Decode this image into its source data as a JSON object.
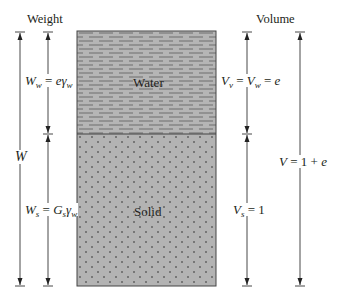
{
  "diagram": {
    "type": "soil-phase-diagram",
    "headers": {
      "left": "Weight",
      "right": "Volume"
    },
    "phases": [
      {
        "name": "water",
        "label": "Water",
        "pattern": "dashes",
        "fill": "#b3b3b3"
      },
      {
        "name": "solid",
        "label": "Solid",
        "pattern": "dots",
        "fill": "#b3b3b3"
      }
    ],
    "left_dimensions": {
      "total": {
        "symbol": "W"
      },
      "water": {
        "lhs": "W",
        "lhs_sub": "w",
        "eq": " = ",
        "rhs": "e",
        "rhs_sym": "γ",
        "rhs_sub": "w"
      },
      "solid": {
        "lhs": "W",
        "lhs_sub": "s",
        "eq": " = ",
        "rhs": "G",
        "rhs_sub1": "s",
        "rhs_sym": "γ",
        "rhs_sub": "w"
      }
    },
    "right_dimensions": {
      "voids": {
        "lhs": "V",
        "lhs_sub": "v",
        "eq1": " = ",
        "mid": "V",
        "mid_sub": "w",
        "eq2": " = ",
        "rhs": "e"
      },
      "solid": {
        "lhs": "V",
        "lhs_sub": "s",
        "eq": " = ",
        "rhs": "1"
      },
      "total": {
        "lhs": "V",
        "eq": " = ",
        "one": "1",
        "plus": " + ",
        "rhs": "e"
      }
    },
    "colors": {
      "line": "#333333",
      "phase_fill": "#b3b3b3",
      "pattern_mark": "#555555",
      "dot": "#2a2a2a"
    }
  }
}
